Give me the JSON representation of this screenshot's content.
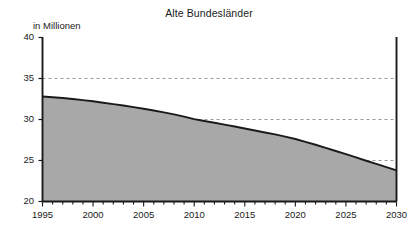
{
  "chart_data": {
    "type": "area",
    "title": "Alte Bundesländer",
    "ylabel": "in Millionen",
    "xlabel": "",
    "ylim": [
      20,
      40
    ],
    "xlim": [
      1995,
      2030
    ],
    "grid": "horizontal-dashed",
    "legend": "none",
    "yticks": [
      20,
      25,
      30,
      35,
      40
    ],
    "ytick_labels": [
      "20",
      "25",
      "30",
      "35",
      "40"
    ],
    "xticks": [
      1995,
      2000,
      2005,
      2010,
      2015,
      2020,
      2025,
      2030
    ],
    "xtick_labels": [
      "1995",
      "2000",
      "2005",
      "2010",
      "2015",
      "2020",
      "2025",
      "2030"
    ],
    "x_minor_tick_interval": 1,
    "series": [
      {
        "name": "Alte Bundesländer",
        "x": [
          1995,
          1996,
          1997,
          1998,
          1999,
          2000,
          2001,
          2002,
          2003,
          2004,
          2005,
          2006,
          2007,
          2008,
          2009,
          2010,
          2011,
          2012,
          2013,
          2014,
          2015,
          2016,
          2017,
          2018,
          2019,
          2020,
          2021,
          2022,
          2023,
          2024,
          2025,
          2026,
          2027,
          2028,
          2029,
          2030
        ],
        "values": [
          32.8,
          32.72,
          32.62,
          32.5,
          32.37,
          32.22,
          32.05,
          31.88,
          31.7,
          31.51,
          31.31,
          31.09,
          30.87,
          30.63,
          30.35,
          30.04,
          29.82,
          29.6,
          29.38,
          29.14,
          28.9,
          28.66,
          28.42,
          28.18,
          27.91,
          27.62,
          27.28,
          26.92,
          26.54,
          26.16,
          25.78,
          25.38,
          24.97,
          24.58,
          24.18,
          23.8
        ],
        "fill_color": "#a8a8a8",
        "line_color": "#1a1a1a"
      }
    ],
    "colors": {
      "area_fill": "#a8a8a8",
      "line": "#1a1a1a",
      "axis": "#1a1a1a",
      "gridline": "#9a9a9a",
      "background": "#ffffff",
      "text": "#1a1a1a"
    }
  }
}
